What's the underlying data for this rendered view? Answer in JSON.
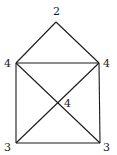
{
  "diagram": {
    "type": "graph",
    "vertices": [
      {
        "id": "apex",
        "degree_label": "2",
        "x": 56,
        "y": 22,
        "label_x": 53,
        "label_y": 15
      },
      {
        "id": "top-left",
        "degree_label": "4",
        "x": 16,
        "y": 63,
        "label_x": 4,
        "label_y": 67
      },
      {
        "id": "top-right",
        "degree_label": "4",
        "x": 99,
        "y": 63,
        "label_x": 103,
        "label_y": 67
      },
      {
        "id": "center",
        "degree_label": "4",
        "x": 57,
        "y": 103,
        "label_x": 64,
        "label_y": 107
      },
      {
        "id": "bottom-left",
        "degree_label": "3",
        "x": 16,
        "y": 143,
        "label_x": 4,
        "label_y": 151
      },
      {
        "id": "bottom-right",
        "degree_label": "3",
        "x": 100,
        "y": 143,
        "label_x": 103,
        "label_y": 151
      }
    ],
    "edges": [
      [
        "apex",
        "top-left"
      ],
      [
        "apex",
        "top-right"
      ],
      [
        "top-left",
        "top-right"
      ],
      [
        "top-left",
        "bottom-left"
      ],
      [
        "top-right",
        "bottom-right"
      ],
      [
        "bottom-left",
        "bottom-right"
      ],
      [
        "top-left",
        "bottom-right"
      ],
      [
        "top-right",
        "bottom-left"
      ]
    ]
  }
}
